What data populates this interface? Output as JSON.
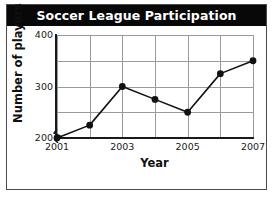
{
  "figure": {
    "title": "Soccer League Participation"
  },
  "chart_data": {
    "type": "line",
    "title": "Soccer League Participation",
    "xlabel": "Year",
    "ylabel": "Number of players",
    "x": [
      2001,
      2002,
      2003,
      2004,
      2005,
      2006,
      2007
    ],
    "values": [
      200,
      225,
      300,
      275,
      250,
      325,
      350
    ],
    "series": [
      {
        "name": "Number of players",
        "values": [
          200,
          225,
          300,
          275,
          250,
          325,
          350
        ]
      }
    ],
    "xlim": [
      2001,
      2007
    ],
    "ylim": [
      200,
      400
    ],
    "y_ticks_major": [
      200,
      300,
      400
    ],
    "y_ticks_minor": [
      250,
      350
    ],
    "y_tick_labels": [
      "200",
      "300",
      "400"
    ],
    "x_tick_labels": [
      "2001",
      "",
      "2003",
      "",
      "2005",
      "",
      "2007"
    ],
    "x_tick_labels_shown": [
      "2001",
      "2003",
      "2005",
      "2007"
    ],
    "grid": true,
    "legend": "none",
    "y_axis_break": true,
    "marker": "filled-circle",
    "line_color": "#111111",
    "marker_color": "#111111",
    "grid_color": "#9a9a9a",
    "title_background": "#080808",
    "title_color": "#ffffff",
    "background": "#ffffff"
  }
}
